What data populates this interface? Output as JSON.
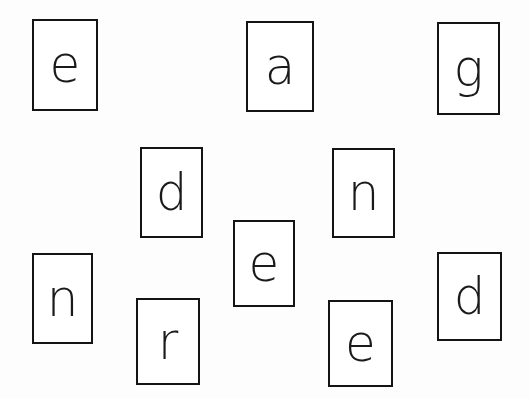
{
  "cards": [
    {
      "letter": "e",
      "x": 32,
      "y": 19,
      "w": 66,
      "h": 92
    },
    {
      "letter": "a",
      "x": 246,
      "y": 21,
      "w": 68,
      "h": 91
    },
    {
      "letter": "g",
      "x": 437,
      "y": 22,
      "w": 63,
      "h": 93
    },
    {
      "letter": "d",
      "x": 140,
      "y": 147,
      "w": 63,
      "h": 91
    },
    {
      "letter": "n",
      "x": 332,
      "y": 148,
      "w": 63,
      "h": 90
    },
    {
      "letter": "e",
      "x": 233,
      "y": 220,
      "w": 62,
      "h": 87
    },
    {
      "letter": "n",
      "x": 32,
      "y": 253,
      "w": 61,
      "h": 91
    },
    {
      "letter": "r",
      "x": 136,
      "y": 298,
      "w": 64,
      "h": 87
    },
    {
      "letter": "e",
      "x": 328,
      "y": 300,
      "w": 65,
      "h": 87
    },
    {
      "letter": "d",
      "x": 437,
      "y": 252,
      "w": 65,
      "h": 89
    }
  ],
  "colors": {
    "background": "#fdfdfd",
    "card_border": "#141414",
    "letter": "#1a1a1a"
  }
}
